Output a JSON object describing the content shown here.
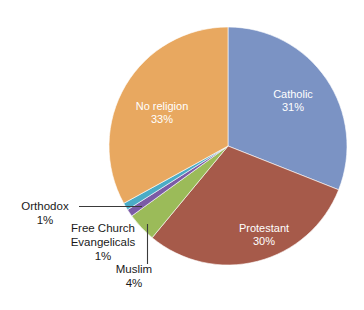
{
  "chart_data": {
    "type": "pie",
    "title": "",
    "subtitle": "",
    "xlabel": "",
    "ylabel": "",
    "legend_position": "none",
    "grid": false,
    "units": "percent",
    "start_angle_deg": 0,
    "direction": "clockwise",
    "categories": [
      "Catholic",
      "Protestant",
      "Muslim",
      "Free Church Evangelicals",
      "Orthodox",
      "No religion"
    ],
    "values": [
      31,
      30,
      4,
      1,
      1,
      33
    ],
    "slices": [
      {
        "name": "Catholic",
        "value": 31,
        "value_text": "31%",
        "color": "#7B93C4",
        "label_placement": "inside",
        "label_color": "#ffffff"
      },
      {
        "name": "Protestant",
        "value": 30,
        "value_text": "30%",
        "color": "#A65A4A",
        "label_placement": "inside",
        "label_color": "#ffffff"
      },
      {
        "name": "Muslim",
        "value": 4,
        "value_text": "4%",
        "color": "#9BBB59",
        "label_placement": "callout",
        "label_color": "#1a1a1a"
      },
      {
        "name": "Free Church Evangelicals",
        "value": 1,
        "value_text": "1%",
        "color": "#7B5BA6",
        "label_placement": "callout",
        "label_color": "#1a1a1a"
      },
      {
        "name": "Orthodox",
        "value": 1,
        "value_text": "1%",
        "color": "#4BACC6",
        "label_placement": "callout",
        "label_color": "#1a1a1a"
      },
      {
        "name": "No religion",
        "value": 33,
        "value_text": "33%",
        "color": "#E8A860",
        "label_placement": "inside",
        "label_color": "#ffffff"
      }
    ],
    "labels": {
      "catholic_name": "Catholic",
      "catholic_value": "31%",
      "protestant_name": "Protestant",
      "protestant_value": "30%",
      "noreligion_name": "No religion",
      "noreligion_value": "33%",
      "muslim_name": "Muslim",
      "muslim_value": "4%",
      "orthodox_name": "Orthodox",
      "orthodox_value": "1%",
      "freechurch_name_line1": "Free Church",
      "freechurch_name_line2": "Evangelicals",
      "freechurch_value": "1%"
    },
    "leader_lines": [
      {
        "for": "Orthodox",
        "orientation": "horizontal",
        "color": "#3a3a3a"
      },
      {
        "for": "Muslim",
        "orientation": "vertical",
        "color": "#3a3a3a"
      }
    ],
    "background_color": "#ffffff"
  }
}
